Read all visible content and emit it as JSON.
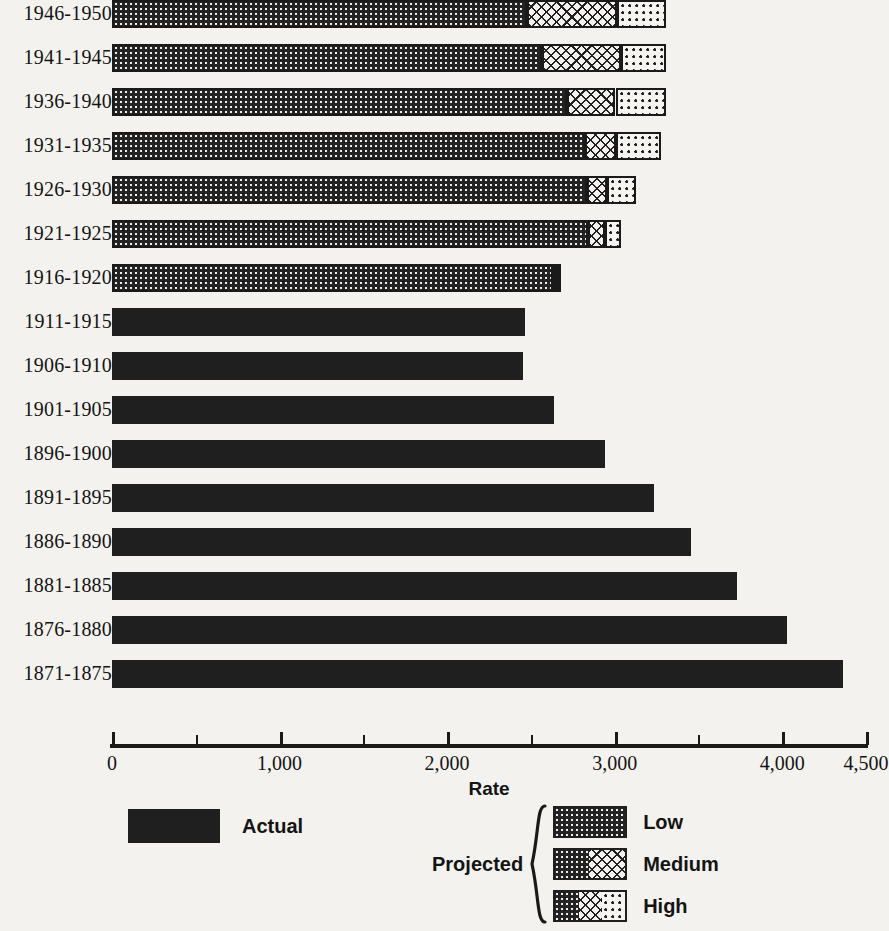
{
  "chart_data": {
    "type": "bar",
    "orientation": "horizontal",
    "stacked": true,
    "title": "",
    "xlabel": "Rate",
    "ylabel": "",
    "xlim": [
      0,
      4500
    ],
    "grid": false,
    "legend_position": "bottom",
    "xticks": [
      0,
      500,
      1000,
      1500,
      2000,
      2500,
      3000,
      3500,
      4000,
      4500
    ],
    "xticklabels_major": [
      {
        "value": 0,
        "label": "0"
      },
      {
        "value": 1000,
        "label": "1,000"
      },
      {
        "value": 2000,
        "label": "2,000"
      },
      {
        "value": 3000,
        "label": "3,000"
      },
      {
        "value": 4000,
        "label": "4,000"
      },
      {
        "value": 4500,
        "label": "4,500"
      }
    ],
    "minor_ticks": [
      500,
      1500,
      2500,
      3500
    ],
    "categories": [
      "1946-1950",
      "1941-1945",
      "1936-1940",
      "1931-1935",
      "1926-1930",
      "1921-1925",
      "1916-1920",
      "1911-1915",
      "1906-1910",
      "1901-1905",
      "1896-1900",
      "1891-1895",
      "1886-1890",
      "1881-1885",
      "1876-1880",
      "1871-1875"
    ],
    "series": [
      {
        "name": "Actual",
        "key": "actual"
      },
      {
        "name": "Low",
        "key": "low"
      },
      {
        "name": "Medium",
        "key": "medium"
      },
      {
        "name": "High",
        "key": "high"
      }
    ],
    "rows": [
      {
        "category": "1946-1950",
        "kind": "projected",
        "low": 2475,
        "medium": 3015,
        "high": 3305
      },
      {
        "category": "1941-1945",
        "kind": "projected",
        "low": 2565,
        "medium": 3035,
        "high": 3305
      },
      {
        "category": "1936-1940",
        "kind": "projected",
        "low": 2715,
        "medium": 3005,
        "high": 3305
      },
      {
        "category": "1931-1935",
        "kind": "projected",
        "low": 2825,
        "medium": 3005,
        "high": 3275
      },
      {
        "category": "1926-1930",
        "kind": "projected",
        "low": 2835,
        "medium": 2955,
        "high": 3125
      },
      {
        "category": "1921-1925",
        "kind": "projected",
        "low": 2840,
        "medium": 2945,
        "high": 3035
      },
      {
        "category": "1916-1920",
        "kind": "projected",
        "low": 2630,
        "medium": 2655,
        "high": 2675
      },
      {
        "category": "1911-1915",
        "kind": "actual",
        "actual": 2465
      },
      {
        "category": "1906-1910",
        "kind": "actual",
        "actual": 2450
      },
      {
        "category": "1901-1905",
        "kind": "actual",
        "actual": 2640
      },
      {
        "category": "1896-1900",
        "kind": "actual",
        "actual": 2945
      },
      {
        "category": "1891-1895",
        "kind": "actual",
        "actual": 3235
      },
      {
        "category": "1886-1890",
        "kind": "actual",
        "actual": 3455
      },
      {
        "category": "1881-1885",
        "kind": "actual",
        "actual": 3730
      },
      {
        "category": "1876-1880",
        "kind": "actual",
        "actual": 4030
      },
      {
        "category": "1871-1875",
        "kind": "actual",
        "actual": 4360
      }
    ]
  },
  "legend": {
    "actual_label": "Actual",
    "projected_label": "Projected",
    "low_label": "Low",
    "medium_label": "Medium",
    "high_label": "High"
  },
  "colors": {
    "ink": "#1f1f1f",
    "paper": "#f4f2ee",
    "actual_fill": "#1f1f1f"
  }
}
